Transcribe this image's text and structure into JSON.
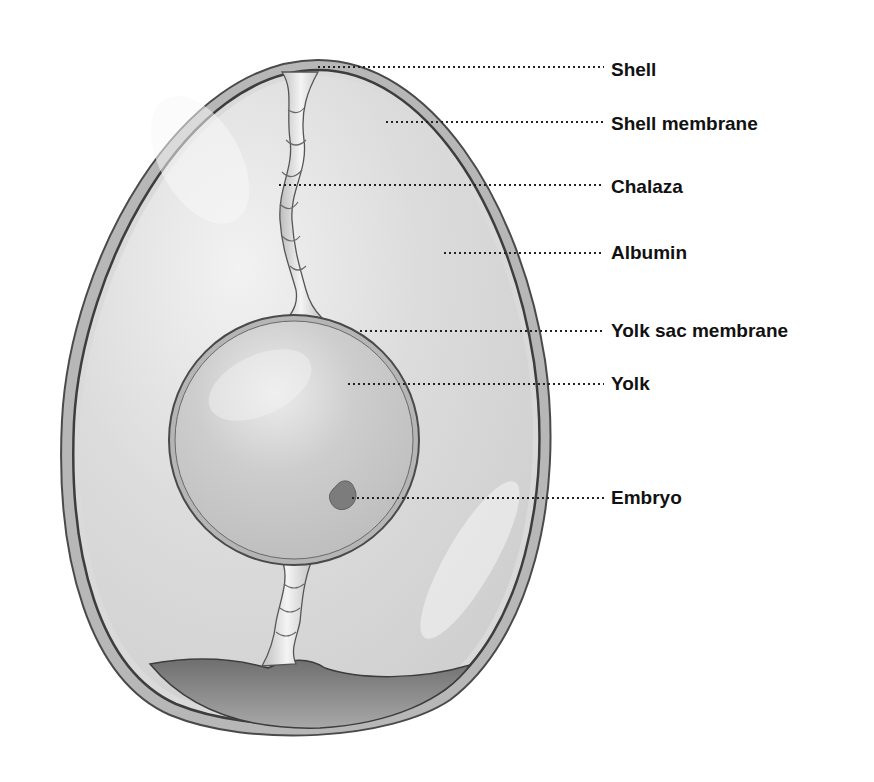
{
  "diagram": {
    "colors": {
      "background": "#ffffff",
      "shell": "#b9b9b9",
      "shell_edge": "#4a4a4a",
      "albumin": "#d9d9d9",
      "yolk": "#c6c6c6",
      "chalaza": "#e6e6e6",
      "air_cell": "#8e8e8e",
      "embryo": "#7a7a7a",
      "leader_line": "#222222",
      "label_text": "#111111"
    },
    "labels": [
      {
        "id": "shell",
        "text": "Shell",
        "x": 611,
        "y": 70,
        "point_x": 318,
        "point_y": 67
      },
      {
        "id": "shell-membrane",
        "text": "Shell membrane",
        "x": 611,
        "y": 124,
        "point_x": 386,
        "point_y": 122
      },
      {
        "id": "chalaza",
        "text": "Chalaza",
        "x": 611,
        "y": 187,
        "point_x": 279,
        "point_y": 185
      },
      {
        "id": "albumin",
        "text": "Albumin",
        "x": 611,
        "y": 253,
        "point_x": 444,
        "point_y": 253
      },
      {
        "id": "yolk-sac-membrane",
        "text": "Yolk sac membrane",
        "x": 611,
        "y": 331,
        "point_x": 360,
        "point_y": 331
      },
      {
        "id": "yolk",
        "text": "Yolk",
        "x": 611,
        "y": 384,
        "point_x": 348,
        "point_y": 384
      },
      {
        "id": "embryo",
        "text": "Embryo",
        "x": 611,
        "y": 498,
        "point_x": 352,
        "point_y": 498
      }
    ]
  }
}
